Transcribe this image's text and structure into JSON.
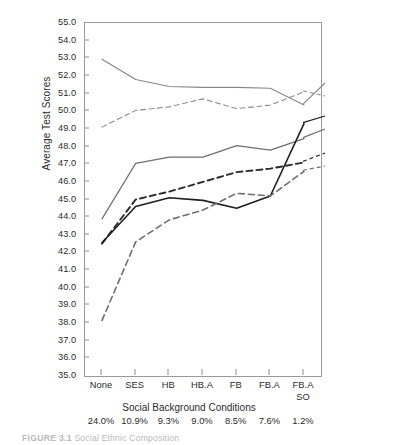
{
  "chart_data": {
    "type": "line",
    "title": "",
    "xlabel": "Social Background Conditions",
    "ylabel": "Average Test Scores",
    "ylim": [
      35.0,
      55.0
    ],
    "ytick_step": 1.0,
    "grid": false,
    "legend_position": "right-inline",
    "categories": [
      "None",
      "SES",
      "HB",
      "HB.A",
      "FB",
      "FB.A",
      "FB.A SO"
    ],
    "category_lines": [
      [
        "None",
        ""
      ],
      [
        "SES",
        ""
      ],
      [
        "HB",
        ""
      ],
      [
        "HB.A",
        ""
      ],
      [
        "FB",
        ""
      ],
      [
        "FB.A",
        ""
      ],
      [
        "FB.A",
        "SO"
      ]
    ],
    "percentages": [
      "24.0%",
      "10.9%",
      "9.3%",
      "9.0%",
      "8.5%",
      "7.6%",
      "1.2%"
    ],
    "ytick_labels": [
      "55.0",
      "54.0",
      "53.0",
      "52.0",
      "51.0",
      "50.0",
      "49.0",
      "48.0",
      "47.0",
      "46.0",
      "45.0",
      "44.0",
      "43.0",
      "42.0",
      "41.0",
      "40.0",
      "39.0",
      "38.0",
      "37.0",
      "36.0",
      "35.0"
    ],
    "series": [
      {
        "name": "Asian",
        "style": "solid",
        "color": "#878787",
        "width": 1.1,
        "values": [
          52.95,
          51.8,
          51.4,
          51.35,
          51.35,
          51.3,
          50.35
        ]
      },
      {
        "name": "White",
        "style": "dashed",
        "color": "#8c8c8c",
        "width": 1.1,
        "values": [
          49.1,
          50.05,
          50.25,
          50.7,
          50.15,
          50.35,
          51.1
        ]
      },
      {
        "name": "American Indian",
        "style": "solid",
        "color": "#6e6e6e",
        "width": 1.2,
        "values": [
          43.9,
          47.05,
          47.4,
          47.4,
          48.05,
          47.8,
          48.45
        ]
      },
      {
        "name": "Mexican",
        "style": "dashed",
        "color": "#2b2b2b",
        "width": 1.9,
        "values": [
          42.5,
          45.0,
          45.45,
          46.0,
          46.55,
          46.75,
          47.1
        ]
      },
      {
        "name": "Black",
        "style": "solid",
        "color": "#1f1f1f",
        "width": 1.6,
        "values": [
          42.55,
          44.6,
          45.1,
          44.95,
          44.5,
          45.2,
          49.3
        ]
      },
      {
        "name": "Puerto Rican",
        "style": "dashed",
        "color": "#6e6e6e",
        "width": 1.6,
        "values": [
          38.15,
          42.6,
          43.85,
          44.4,
          45.35,
          45.2,
          46.6
        ]
      }
    ],
    "inline_legend": [
      {
        "label": "Asian",
        "x": 328,
        "y": 86
      },
      {
        "label": "White",
        "x": 328,
        "y": 99
      },
      {
        "label": "Black",
        "x": 328,
        "y": 119
      },
      {
        "label": "American Indian",
        "x": 328,
        "y": 132
      },
      {
        "label": "Mexican",
        "x": 328,
        "y": 156
      },
      {
        "label": "Puerto Rican",
        "x": 328,
        "y": 169
      }
    ]
  },
  "caption": {
    "figure_number": "FIGURE 3.1",
    "text": "Social Ethnic Composition"
  }
}
